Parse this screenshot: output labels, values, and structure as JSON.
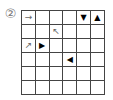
{
  "label": "②",
  "grid": {
    "rows": 6,
    "cols": 6,
    "cells": [
      [
        {
          "symbol": "→",
          "kind": "thin-arrow-right"
        },
        {
          "symbol": "",
          "kind": "empty"
        },
        {
          "symbol": "",
          "kind": "empty"
        },
        {
          "symbol": "",
          "kind": "empty"
        },
        {
          "symbol": "▼",
          "kind": "solid-triangle-down"
        },
        {
          "symbol": "▲",
          "kind": "solid-triangle-up"
        }
      ],
      [
        {
          "symbol": "",
          "kind": "empty"
        },
        {
          "symbol": "",
          "kind": "empty"
        },
        {
          "symbol": "↖",
          "kind": "thin-arrow-up-left"
        },
        {
          "symbol": "",
          "kind": "empty"
        },
        {
          "symbol": "",
          "kind": "empty"
        },
        {
          "symbol": "",
          "kind": "empty"
        }
      ],
      [
        {
          "symbol": "↗",
          "kind": "thin-arrow-up-right"
        },
        {
          "symbol": "▶",
          "kind": "solid-triangle-right"
        },
        {
          "symbol": "",
          "kind": "empty"
        },
        {
          "symbol": "",
          "kind": "empty"
        },
        {
          "symbol": "",
          "kind": "empty"
        },
        {
          "symbol": "",
          "kind": "empty"
        }
      ],
      [
        {
          "symbol": "",
          "kind": "empty"
        },
        {
          "symbol": "",
          "kind": "empty"
        },
        {
          "symbol": "",
          "kind": "empty"
        },
        {
          "symbol": "◀",
          "kind": "solid-triangle-left"
        },
        {
          "symbol": "",
          "kind": "empty"
        },
        {
          "symbol": "",
          "kind": "empty"
        }
      ],
      [
        {
          "symbol": "",
          "kind": "empty"
        },
        {
          "symbol": "",
          "kind": "empty"
        },
        {
          "symbol": "",
          "kind": "empty"
        },
        {
          "symbol": "",
          "kind": "empty"
        },
        {
          "symbol": "",
          "kind": "empty"
        },
        {
          "symbol": "",
          "kind": "empty"
        }
      ],
      [
        {
          "symbol": "",
          "kind": "empty"
        },
        {
          "symbol": "",
          "kind": "empty"
        },
        {
          "symbol": "",
          "kind": "empty"
        },
        {
          "symbol": "",
          "kind": "empty"
        },
        {
          "symbol": "",
          "kind": "empty"
        },
        {
          "symbol": "",
          "kind": "empty"
        }
      ]
    ]
  },
  "colors": {
    "grid_line": "#444444",
    "thin_arrow": "#666666",
    "solid_triangle": "#000000",
    "label": "#777777"
  }
}
